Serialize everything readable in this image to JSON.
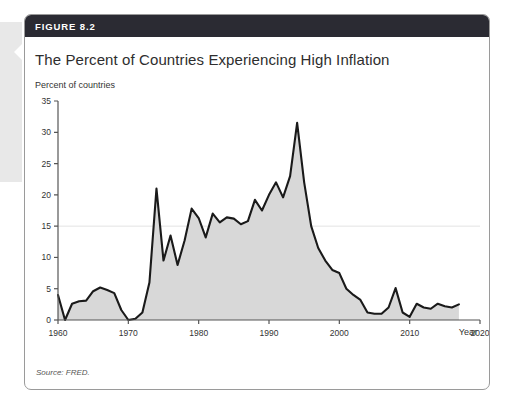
{
  "figure": {
    "number_label": "FIGURE 8.2",
    "title": "The Percent of Countries Experiencing High Inflation",
    "source": "Source: FRED.",
    "colors": {
      "header_bar": "#2b2b33",
      "card_border": "#9a9a9a",
      "line": "#1a1a1a",
      "area_fill": "#d8d8d8",
      "axis": "#555555",
      "gridline": "#e4e4e4",
      "text": "#2e2e2e"
    }
  },
  "chart_data": {
    "type": "area",
    "title": "The Percent of Countries Experiencing High Inflation",
    "ylabel": "Percent of countries",
    "xlabel": "Year",
    "xlim": [
      1960,
      2020
    ],
    "ylim": [
      0,
      35
    ],
    "xticks": [
      1960,
      1970,
      1980,
      1990,
      2000,
      2010,
      2020
    ],
    "yticks": [
      0,
      5,
      10,
      15,
      20,
      25,
      30,
      35
    ],
    "grid": "single horizontal gridline at y=15",
    "legend": "none",
    "series": [
      {
        "name": "Percent of countries experiencing high inflation",
        "x": [
          1960,
          1961,
          1962,
          1963,
          1964,
          1965,
          1966,
          1967,
          1968,
          1969,
          1970,
          1971,
          1972,
          1973,
          1974,
          1975,
          1976,
          1977,
          1978,
          1979,
          1980,
          1981,
          1982,
          1983,
          1984,
          1985,
          1986,
          1987,
          1988,
          1989,
          1990,
          1991,
          1992,
          1993,
          1994,
          1995,
          1996,
          1997,
          1998,
          1999,
          2000,
          2001,
          2002,
          2003,
          2004,
          2005,
          2006,
          2007,
          2008,
          2009,
          2010,
          2011,
          2012,
          2013,
          2014,
          2015,
          2016,
          2017
        ],
        "values": [
          4.0,
          0.0,
          2.6,
          3.0,
          3.1,
          4.6,
          5.2,
          4.8,
          4.3,
          1.6,
          0.0,
          0.2,
          1.2,
          6.0,
          21.0,
          9.5,
          13.5,
          8.8,
          12.7,
          17.8,
          16.3,
          13.2,
          17.0,
          15.6,
          16.4,
          16.2,
          15.3,
          15.8,
          19.2,
          17.5,
          20.0,
          22.0,
          19.6,
          23.0,
          31.5,
          22.0,
          15.0,
          11.5,
          9.5,
          8.0,
          7.5,
          5.0,
          4.0,
          3.2,
          1.2,
          1.0,
          1.0,
          2.0,
          5.1,
          1.2,
          0.5,
          2.6,
          2.0,
          1.8,
          2.6,
          2.2,
          2.0,
          2.5
        ]
      }
    ]
  },
  "axis_labels": {
    "y": [
      "0",
      "5",
      "10",
      "15",
      "20",
      "25",
      "30",
      "35"
    ],
    "x": [
      "1960",
      "1970",
      "1980",
      "1990",
      "2000",
      "2010",
      "2020"
    ],
    "x_axis_name": "Year",
    "y_axis_name": "Percent of countries"
  }
}
